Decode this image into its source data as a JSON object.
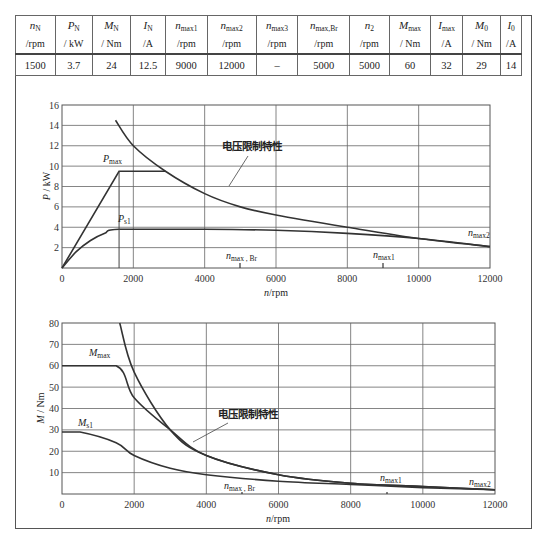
{
  "table": {
    "headers": [
      {
        "sym": "n",
        "sub": "N",
        "unit": "/rpm"
      },
      {
        "sym": "P",
        "sub": "N",
        "unit": "/ kW"
      },
      {
        "sym": "M",
        "sub": "N",
        "unit": "/ Nm"
      },
      {
        "sym": "I",
        "sub": "N",
        "unit": "/A"
      },
      {
        "sym": "n",
        "sub": "max1",
        "unit": "/rpm"
      },
      {
        "sym": "n",
        "sub": "max2",
        "unit": "/rpm"
      },
      {
        "sym": "n",
        "sub": "max3",
        "unit": "/rpm"
      },
      {
        "sym": "n",
        "sub": "max,Br",
        "unit": "/rpm"
      },
      {
        "sym": "n",
        "sub": "2",
        "unit": "/rpm"
      },
      {
        "sym": "M",
        "sub": "max",
        "unit": "/ Nm"
      },
      {
        "sym": "I",
        "sub": "max",
        "unit": "/A"
      },
      {
        "sym": "M",
        "sub": "0",
        "unit": "/ Nm"
      },
      {
        "sym": "I",
        "sub": "0",
        "unit": "/A"
      }
    ],
    "values": [
      "1500",
      "3.7",
      "24",
      "12.5",
      "9000",
      "12000",
      "–",
      "5000",
      "5000",
      "60",
      "32",
      "29",
      "14"
    ]
  },
  "chart_data": [
    {
      "type": "line",
      "title": "",
      "xlabel": "n/rpm",
      "ylabel": "P / kW",
      "xlim": [
        0,
        12000
      ],
      "ylim": [
        0,
        16
      ],
      "xticks": [
        "0",
        "2000",
        "4000",
        "6000",
        "8000",
        "10000",
        "12000"
      ],
      "yticks": [
        "2",
        "4",
        "6",
        "8",
        "10",
        "12",
        "14",
        "16"
      ],
      "grid": true,
      "series": [
        {
          "name": "P_max",
          "x": [
            0,
            1600,
            2900
          ],
          "y": [
            0,
            9.5,
            9.5
          ]
        },
        {
          "name": "P_s1",
          "x": [
            0,
            400,
            800,
            1200,
            1600,
            4000,
            6000,
            8000,
            10000,
            12000
          ],
          "y": [
            0,
            1.6,
            2.7,
            3.4,
            3.8,
            3.8,
            3.7,
            3.4,
            2.9,
            2.1
          ]
        },
        {
          "name": "电压限制特性",
          "x": [
            1500,
            2000,
            2900,
            4000,
            5000,
            6000,
            8000,
            10000,
            12000
          ],
          "y": [
            14.5,
            12.0,
            9.5,
            7.3,
            6.0,
            5.2,
            4.0,
            2.9,
            2.1
          ]
        }
      ],
      "annotations": [
        "P_max",
        "P_s1",
        "电压限制特性",
        "n_max, Br",
        "n_max1",
        "n_max2"
      ]
    },
    {
      "type": "line",
      "title": "",
      "xlabel": "n/rpm",
      "ylabel": "M / Nm",
      "xlim": [
        0,
        12000
      ],
      "ylim": [
        0,
        80
      ],
      "xticks": [
        "0",
        "2000",
        "4000",
        "6000",
        "8000",
        "10000",
        "12000"
      ],
      "yticks": [
        "10",
        "20",
        "30",
        "40",
        "50",
        "60",
        "70",
        "80"
      ],
      "grid": true,
      "series": [
        {
          "name": "M_max",
          "x": [
            0,
            1500,
            2000,
            3000,
            4000,
            6000,
            8000,
            10000,
            12000
          ],
          "y": [
            60,
            60,
            45,
            30,
            18,
            9,
            5,
            3.5,
            2
          ]
        },
        {
          "name": "M_s1",
          "x": [
            0,
            500,
            1500,
            2000,
            3000,
            4000,
            6000,
            8000,
            10000,
            12000
          ],
          "y": [
            29,
            29,
            24,
            18,
            12,
            9,
            6,
            4.5,
            3,
            2
          ]
        },
        {
          "name": "电压限制特性",
          "x": [
            1600,
            2000,
            3000,
            4000,
            6000,
            8000,
            10000,
            12000
          ],
          "y": [
            80,
            57,
            30,
            18,
            9,
            5,
            3.5,
            2
          ]
        }
      ],
      "annotations": [
        "M_max",
        "M_s1",
        "电压限制特性",
        "n_max, Br",
        "n_max1",
        "n_max2"
      ]
    }
  ],
  "labels": {
    "p_max": "P",
    "p_max_sub": "max",
    "p_s1": "P",
    "p_s1_sub": "s1",
    "m_max": "M",
    "m_max_sub": "max",
    "m_s1": "M",
    "m_s1_sub": "s1",
    "voltage_limit": "电压限制特性",
    "n": "n",
    "nmaxbr_sub": "max , Br",
    "nmax1_sub": "max1",
    "nmax2_sub": "max2",
    "xlabel_unit": "/rpm",
    "top_ylabel_sym": "P",
    "top_ylabel_unit": " / kW",
    "bot_ylabel_sym": "M",
    "bot_ylabel_unit": " / Nm",
    "x_ticks": [
      "0",
      "2000",
      "4000",
      "6000",
      "8000",
      "10000",
      "12000"
    ],
    "top_y_ticks": [
      "2",
      "4",
      "6",
      "8",
      "10",
      "12",
      "14",
      "16"
    ],
    "bot_y_ticks": [
      "10",
      "20",
      "30",
      "40",
      "50",
      "60",
      "70",
      "80"
    ]
  }
}
